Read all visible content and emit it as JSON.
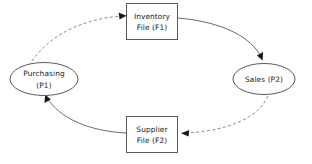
{
  "diagram": {
    "type": "data-flow-diagram",
    "background_color": "#ffffff",
    "shape_stroke_color": "#5a5a5a",
    "solid_flow_color": "#6b6b6b",
    "dashed_flow_color": "#8a8a8a",
    "arrowhead_color": "#1a1a1a",
    "text_color": "#1a1a1a",
    "nodes": {
      "inventory_file": {
        "shape": "rectangle",
        "line1": "Inventory",
        "line2": "File (F1)",
        "id_code": "F1"
      },
      "sales": {
        "shape": "ellipse",
        "line1": "Sales (P2)",
        "line2": "",
        "id_code": "P2"
      },
      "supplier_file": {
        "shape": "rectangle",
        "line1": "Supplier",
        "line2": "File (F2)",
        "id_code": "F2"
      },
      "purchasing": {
        "shape": "ellipse",
        "line1": "Purchasing",
        "line2": "(P1)",
        "id_code": "P1"
      }
    },
    "flows": [
      {
        "name": "purchasing-to-inventory",
        "from": "Purchasing (P1)",
        "to": "Inventory File (F1)",
        "style": "dashed",
        "arrow": "end"
      },
      {
        "name": "inventory-to-sales",
        "from": "Inventory File (F1)",
        "to": "Sales (P2)",
        "style": "solid",
        "arrow": "end"
      },
      {
        "name": "sales-to-supplier",
        "from": "Sales (P2)",
        "to": "Supplier File (F2)",
        "style": "dashed",
        "arrow": "end"
      },
      {
        "name": "supplier-to-purchasing",
        "from": "Supplier File (F2)",
        "to": "Purchasing (P1)",
        "style": "solid",
        "arrow": "end"
      }
    ]
  }
}
